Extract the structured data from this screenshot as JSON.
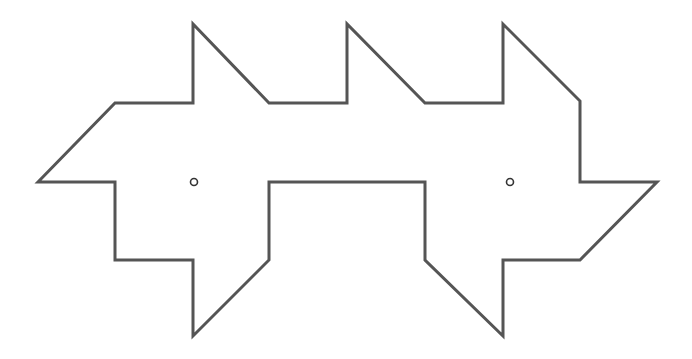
{
  "diagram": {
    "stroke_color": "#555555",
    "stroke_width": 3,
    "fill_color": "#ffffff",
    "background": "#ffffff",
    "outline_points": [
      [
        38,
        182
      ],
      [
        115,
        103
      ],
      [
        193,
        103
      ],
      [
        193,
        24
      ],
      [
        269,
        103
      ],
      [
        347,
        103
      ],
      [
        347,
        24
      ],
      [
        425,
        103
      ],
      [
        503,
        103
      ],
      [
        503,
        24
      ],
      [
        580,
        101
      ],
      [
        580,
        182
      ],
      [
        657,
        182
      ],
      [
        580,
        260
      ],
      [
        503,
        260
      ],
      [
        503,
        336
      ],
      [
        425,
        260
      ],
      [
        425,
        182
      ],
      [
        269,
        182
      ],
      [
        269,
        260
      ],
      [
        193,
        336
      ],
      [
        193,
        260
      ],
      [
        115,
        260
      ],
      [
        115,
        182
      ]
    ],
    "markers": [
      {
        "name": "left-center-point",
        "cx": 194,
        "cy": 182,
        "r": 3.5
      },
      {
        "name": "right-center-point",
        "cx": 510,
        "cy": 182,
        "r": 3.5
      }
    ],
    "marker_stroke": "#333333",
    "marker_fill": "#ffffff"
  }
}
